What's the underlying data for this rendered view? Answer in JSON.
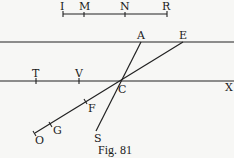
{
  "figure": {
    "caption": "Fig. 81",
    "scale_bar": {
      "labels": [
        "I",
        "M",
        "N",
        "R"
      ]
    },
    "points": {
      "A": "A",
      "E": "E",
      "T": "T",
      "V": "V",
      "C": "C",
      "X": "X",
      "F": "F",
      "G": "G",
      "O": "O",
      "S": "S"
    }
  }
}
